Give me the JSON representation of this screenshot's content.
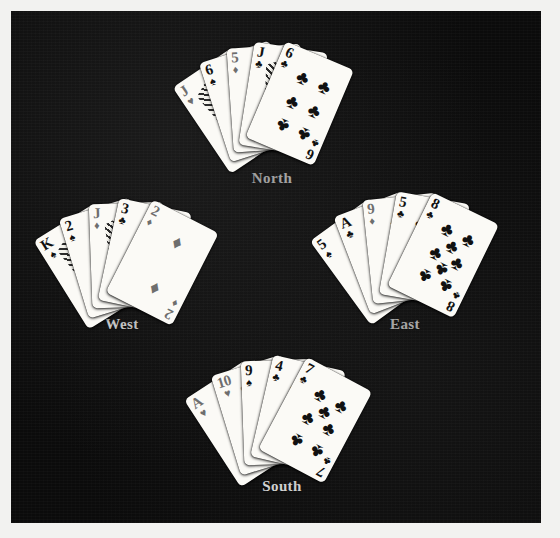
{
  "scene": {
    "background_color": "#0b0b0b",
    "border_color": "#f2f2f0"
  },
  "suit_glyphs": {
    "spade": "♠",
    "heart": "♥",
    "diamond": "♦",
    "club": "♣"
  },
  "hands": [
    {
      "name": "north",
      "label": "North",
      "label_x": 272,
      "label_y": 170,
      "origin_x": 272,
      "origin_y": 98,
      "cards": [
        {
          "rank": "J",
          "suit": "heart",
          "color": "red",
          "angle": -34,
          "court": true
        },
        {
          "rank": "6",
          "suit": "spade",
          "color": "black",
          "angle": -18,
          "court": false
        },
        {
          "rank": "5",
          "suit": "diamond",
          "color": "red",
          "angle": -4,
          "court": false
        },
        {
          "rank": "J",
          "suit": "club",
          "color": "black",
          "angle": 9,
          "court": true
        },
        {
          "rank": "6",
          "suit": "club",
          "color": "black",
          "angle": 23,
          "court": false
        }
      ]
    },
    {
      "name": "west",
      "label": "West",
      "label_x": 122,
      "label_y": 316,
      "origin_x": 130,
      "origin_y": 255,
      "cards": [
        {
          "rank": "K",
          "suit": "spade",
          "color": "black",
          "angle": -32,
          "court": true
        },
        {
          "rank": "2",
          "suit": "spade",
          "color": "black",
          "angle": -17,
          "court": false
        },
        {
          "rank": "J",
          "suit": "diamond",
          "color": "red",
          "angle": -2,
          "court": true
        },
        {
          "rank": "3",
          "suit": "club",
          "color": "black",
          "angle": 12,
          "court": false
        },
        {
          "rank": "2",
          "suit": "diamond",
          "color": "red",
          "angle": 27,
          "court": false
        }
      ]
    },
    {
      "name": "east",
      "label": "East",
      "label_x": 405,
      "label_y": 316,
      "origin_x": 412,
      "origin_y": 248,
      "cards": [
        {
          "rank": "5",
          "suit": "spade",
          "color": "black",
          "angle": -36,
          "court": false
        },
        {
          "rank": "A",
          "suit": "club",
          "color": "black",
          "angle": -21,
          "court": false
        },
        {
          "rank": "9",
          "suit": "diamond",
          "color": "red",
          "angle": -6,
          "court": false
        },
        {
          "rank": "5",
          "suit": "club",
          "color": "black",
          "angle": 10,
          "court": false
        },
        {
          "rank": "8",
          "suit": "club",
          "color": "black",
          "angle": 26,
          "court": false
        }
      ]
    },
    {
      "name": "south",
      "label": "South",
      "label_x": 282,
      "label_y": 478,
      "origin_x": 282,
      "origin_y": 412,
      "cards": [
        {
          "rank": "A",
          "suit": "heart",
          "color": "red",
          "angle": -33,
          "court": false
        },
        {
          "rank": "10",
          "suit": "heart",
          "color": "red",
          "angle": -17,
          "court": false
        },
        {
          "rank": "9",
          "suit": "spade",
          "color": "black",
          "angle": -2,
          "court": false
        },
        {
          "rank": "4",
          "suit": "club",
          "color": "black",
          "angle": 13,
          "court": false
        },
        {
          "rank": "7",
          "suit": "club",
          "color": "black",
          "angle": 28,
          "court": false
        }
      ]
    }
  ],
  "pip_layouts": {
    "A": [
      [
        50,
        50
      ]
    ],
    "2": [
      [
        50,
        18
      ],
      [
        50,
        82
      ]
    ],
    "3": [
      [
        50,
        18
      ],
      [
        50,
        50
      ],
      [
        50,
        82
      ]
    ],
    "4": [
      [
        26,
        18
      ],
      [
        74,
        18
      ],
      [
        26,
        82
      ],
      [
        74,
        82
      ]
    ],
    "5": [
      [
        26,
        18
      ],
      [
        74,
        18
      ],
      [
        50,
        50
      ],
      [
        26,
        82
      ],
      [
        74,
        82
      ]
    ],
    "6": [
      [
        26,
        18
      ],
      [
        74,
        18
      ],
      [
        26,
        50
      ],
      [
        74,
        50
      ],
      [
        26,
        82
      ],
      [
        74,
        82
      ]
    ],
    "7": [
      [
        26,
        18
      ],
      [
        74,
        18
      ],
      [
        50,
        34
      ],
      [
        26,
        50
      ],
      [
        74,
        50
      ],
      [
        26,
        82
      ],
      [
        74,
        82
      ]
    ],
    "8": [
      [
        26,
        18
      ],
      [
        74,
        18
      ],
      [
        50,
        34
      ],
      [
        26,
        50
      ],
      [
        74,
        50
      ],
      [
        50,
        66
      ],
      [
        26,
        82
      ],
      [
        74,
        82
      ]
    ],
    "9": [
      [
        26,
        16
      ],
      [
        74,
        16
      ],
      [
        26,
        40
      ],
      [
        74,
        40
      ],
      [
        50,
        50
      ],
      [
        26,
        62
      ],
      [
        74,
        62
      ],
      [
        26,
        86
      ],
      [
        74,
        86
      ]
    ],
    "10": [
      [
        26,
        14
      ],
      [
        74,
        14
      ],
      [
        50,
        27
      ],
      [
        26,
        38
      ],
      [
        74,
        38
      ],
      [
        26,
        62
      ],
      [
        74,
        62
      ],
      [
        50,
        73
      ],
      [
        26,
        86
      ],
      [
        74,
        86
      ]
    ],
    "J": [],
    "Q": [],
    "K": []
  }
}
